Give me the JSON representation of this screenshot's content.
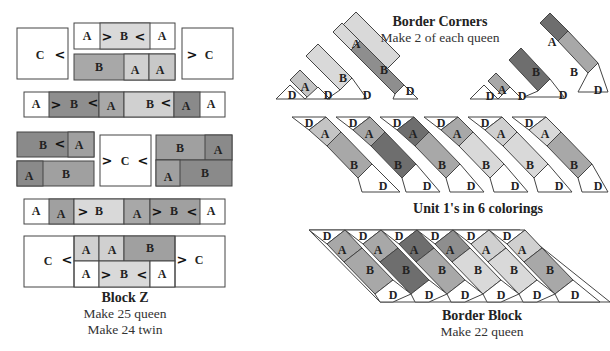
{
  "colors": {
    "white": "#ffffff",
    "light": "#d9d9d9",
    "mid_light": "#c4c4c4",
    "mid": "#a8a8a8",
    "mid_dark": "#8e8e8e",
    "dark": "#6e6e6e",
    "stroke": "#444444"
  },
  "block_z": {
    "title": "Block Z",
    "lines": [
      "Make 25 queen",
      "Make 24 twin"
    ],
    "patch_labels": [
      "A",
      "B",
      "C"
    ]
  },
  "border_corners": {
    "title": "Border Corners",
    "subtitle": "Make 2 of each queen",
    "patch_labels": [
      "A",
      "B",
      "D"
    ]
  },
  "unit1": {
    "caption": "Unit 1's in 6 colorings",
    "count": 6,
    "patch_labels": [
      "A",
      "B",
      "D"
    ]
  },
  "border_block": {
    "title": "Border Block",
    "subtitle": "Make 22 queen",
    "patch_labels": [
      "A",
      "B",
      "D"
    ]
  },
  "symbols": {
    "chevron_right": ">",
    "chevron_left": "<",
    "chevron_up": "^",
    "chevron_down": "v"
  }
}
